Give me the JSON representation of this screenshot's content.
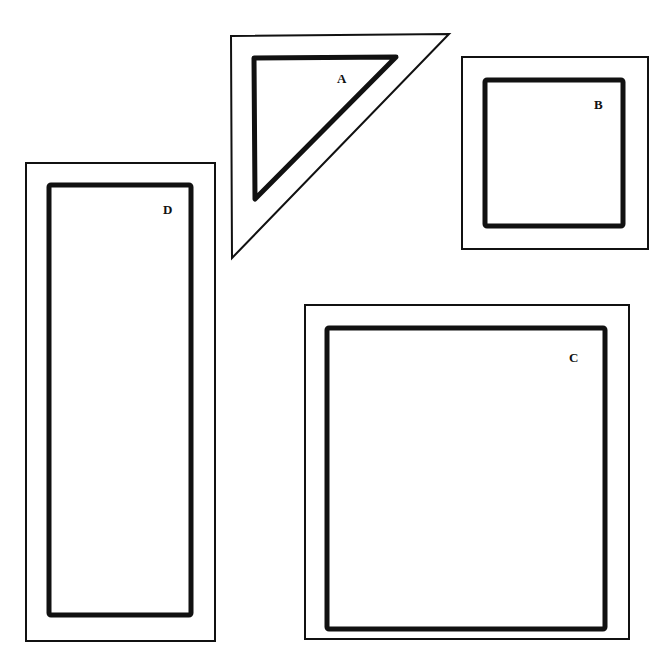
{
  "diagram": {
    "background": "#ffffff",
    "stroke_color": "#111111",
    "shapes": [
      {
        "id": "A",
        "label": "A",
        "type": "triangle",
        "outer_points": "231,36 449,34 232,258",
        "inner_points": "254,58 396,57 255,199",
        "label_pos": [
          337,
          83
        ]
      },
      {
        "id": "B",
        "label": "B",
        "type": "rectangle",
        "outer": {
          "x": 462,
          "y": 57,
          "w": 186,
          "h": 192
        },
        "inner": {
          "x": 485,
          "y": 80,
          "w": 138,
          "h": 146
        },
        "label_pos": [
          598,
          109
        ]
      },
      {
        "id": "C",
        "label": "C",
        "type": "rectangle",
        "outer": {
          "x": 305,
          "y": 305,
          "w": 324,
          "h": 334
        },
        "inner": {
          "x": 327,
          "y": 328,
          "w": 278,
          "h": 301
        },
        "label_pos": [
          573,
          362
        ]
      },
      {
        "id": "D",
        "label": "D",
        "type": "rectangle",
        "outer": {
          "x": 26,
          "y": 163,
          "w": 189,
          "h": 478
        },
        "inner": {
          "x": 49,
          "y": 185,
          "w": 142,
          "h": 430
        },
        "label_pos": [
          168,
          214
        ]
      }
    ]
  }
}
